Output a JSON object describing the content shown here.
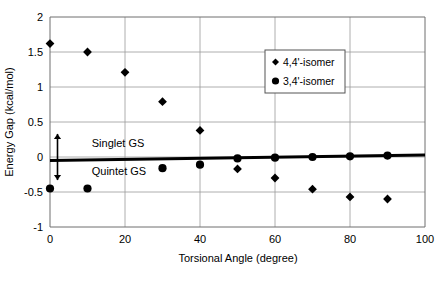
{
  "chart_data": {
    "type": "scatter",
    "title": "",
    "xlabel": "Torsional Angle (degree)",
    "ylabel": "Energy Gap (kcal/mol)",
    "xlim": [
      0,
      100
    ],
    "ylim": [
      -1,
      2
    ],
    "xticks": [
      0,
      20,
      40,
      60,
      80,
      100
    ],
    "yticks": [
      -1,
      -0.5,
      0,
      0.5,
      1,
      1.5,
      2
    ],
    "xtick_labels": [
      "0",
      "20",
      "40",
      "60",
      "80",
      "100"
    ],
    "ytick_labels": [
      "-1",
      "-0.5",
      "0",
      "0.5",
      "1",
      "1.5",
      "2"
    ],
    "grid": true,
    "legend_position": "top-right",
    "series": [
      {
        "name": "4,4'-isomer",
        "marker": "diamond",
        "color": "#000000",
        "x": [
          0,
          10,
          20,
          30,
          40,
          50,
          60,
          70,
          80,
          90
        ],
        "y": [
          1.62,
          1.5,
          1.21,
          0.79,
          0.38,
          -0.17,
          -0.3,
          -0.46,
          -0.57,
          -0.6
        ]
      },
      {
        "name": "3,4'-isomer",
        "marker": "circle",
        "color": "#000000",
        "x": [
          0,
          10,
          30,
          40,
          50,
          60,
          70,
          80,
          90
        ],
        "y": [
          -0.45,
          -0.45,
          -0.16,
          -0.11,
          -0.02,
          -0.01,
          0.0,
          0.01,
          0.02
        ]
      }
    ],
    "zero_line": {
      "label": "zero-reference-line",
      "y_start": -0.05,
      "y_end": 0.03,
      "width": 3
    },
    "annotations": [
      {
        "name": "singlet-gs",
        "text": "Singlet GS",
        "x": 9,
        "y": 0.2,
        "arrow": "up"
      },
      {
        "name": "quintet-gs",
        "text": "Quintet GS",
        "x": 9,
        "y": -0.2,
        "arrow": "down"
      }
    ]
  },
  "legend": {
    "entries": [
      {
        "label": "4,4'-isomer",
        "marker": "diamond"
      },
      {
        "label": "3,4'-isomer",
        "marker": "circle"
      }
    ]
  }
}
